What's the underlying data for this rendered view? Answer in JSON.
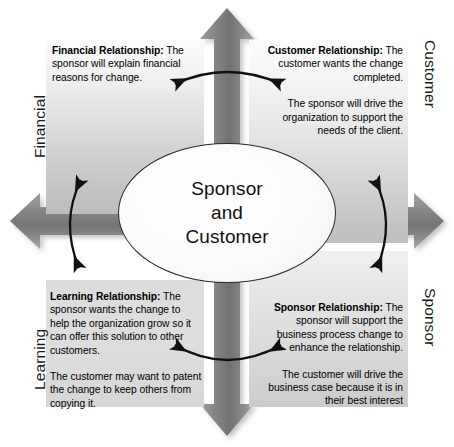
{
  "diagram": {
    "center": {
      "line1": "Sponsor",
      "line2": "and",
      "line3": "Customer"
    },
    "axes": {
      "left_top": "Financial",
      "left_bottom": "Learning",
      "right_top": "Customer",
      "right_bottom": "Sponsor"
    },
    "quadrants": {
      "top_left": {
        "heading": "Financial Relationship:",
        "paragraph1_rest": " The sponsor will explain financial reasons for change.",
        "paragraph2": ""
      },
      "top_right": {
        "heading": "Customer Relationship:",
        "paragraph1_rest": " The customer wants the change completed.",
        "paragraph2": "The sponsor will drive the organization to support the needs of the client."
      },
      "bottom_left": {
        "heading": "Learning Relationship:",
        "paragraph1_rest": " The sponsor wants the change to help the organization grow so it can offer this solution to other customers.",
        "paragraph2": "The customer may want to patent the change to keep others from copying it."
      },
      "bottom_right": {
        "heading": "Sponsor Relationship:",
        "paragraph1_rest": " The sponsor will support the business process change to enhance the relationship.",
        "paragraph2": "The customer will drive the business case because it is in their best interest"
      }
    },
    "colors": {
      "cross_arrow_gray": "#8c8c8c",
      "cross_arrow_gray_dark": "#6f6f6f",
      "quadrant_light": "#fbfbfb",
      "quadrant_dark": "#bdbdbd",
      "text": "#000000",
      "ellipse_border": "#2b2b2b",
      "curved_arrow": "#111111"
    },
    "icons": {
      "up_arrow": "cross-arrow-up",
      "down_arrow": "cross-arrow-down",
      "left_arrow": "cross-arrow-left",
      "right_arrow": "cross-arrow-right",
      "top_link": "curved-double-arrow-top",
      "bottom_link": "curved-double-arrow-bottom",
      "left_link": "curved-double-arrow-left",
      "right_link": "curved-double-arrow-right"
    }
  }
}
